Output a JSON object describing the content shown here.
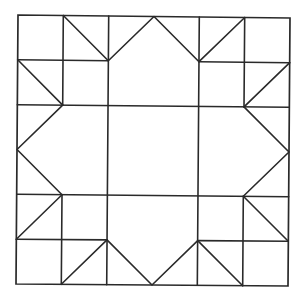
{
  "diagram": {
    "type": "quilt-block-pattern",
    "grid_size": 6,
    "line_color": "#2a2a2a",
    "background": "#ffffff",
    "corners_px": {
      "top_left": [
        18,
        15
      ],
      "top_right": [
        290,
        18
      ],
      "bottom_left": [
        16,
        284
      ],
      "bottom_right": [
        288,
        286
      ]
    },
    "frame": [
      [
        0,
        0
      ],
      [
        6,
        0
      ],
      [
        6,
        6
      ],
      [
        0,
        6
      ]
    ],
    "segments": [
      [
        [
          0,
          1
        ],
        [
          2,
          1
        ]
      ],
      [
        [
          4,
          1
        ],
        [
          6,
          1
        ]
      ],
      [
        [
          0,
          2
        ],
        [
          6,
          2
        ]
      ],
      [
        [
          0,
          4
        ],
        [
          6,
          4
        ]
      ],
      [
        [
          0,
          5
        ],
        [
          2,
          5
        ]
      ],
      [
        [
          4,
          5
        ],
        [
          6,
          5
        ]
      ],
      [
        [
          1,
          0
        ],
        [
          1,
          2
        ]
      ],
      [
        [
          5,
          0
        ],
        [
          5,
          2
        ]
      ],
      [
        [
          1,
          4
        ],
        [
          1,
          6
        ]
      ],
      [
        [
          5,
          4
        ],
        [
          5,
          6
        ]
      ],
      [
        [
          2,
          0
        ],
        [
          2,
          6
        ]
      ],
      [
        [
          4,
          0
        ],
        [
          4,
          6
        ]
      ],
      [
        [
          1,
          0
        ],
        [
          2,
          1
        ]
      ],
      [
        [
          4,
          1
        ],
        [
          5,
          0
        ]
      ],
      [
        [
          0,
          1
        ],
        [
          1,
          2
        ]
      ],
      [
        [
          6,
          1
        ],
        [
          5,
          2
        ]
      ],
      [
        [
          1,
          4
        ],
        [
          0,
          5
        ]
      ],
      [
        [
          5,
          4
        ],
        [
          6,
          5
        ]
      ],
      [
        [
          1,
          6
        ],
        [
          2,
          5
        ]
      ],
      [
        [
          4,
          5
        ],
        [
          5,
          6
        ]
      ]
    ],
    "polylines": [
      [
        [
          2,
          1
        ],
        [
          3,
          0
        ],
        [
          4,
          1
        ]
      ],
      [
        [
          1,
          2
        ],
        [
          0,
          3
        ],
        [
          1,
          4
        ]
      ],
      [
        [
          5,
          2
        ],
        [
          6,
          3
        ],
        [
          5,
          4
        ]
      ],
      [
        [
          2,
          5
        ],
        [
          3,
          6
        ],
        [
          4,
          5
        ]
      ]
    ]
  }
}
